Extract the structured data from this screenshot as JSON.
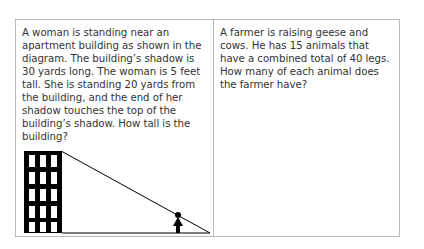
{
  "problems": [
    {
      "text": "A woman is standing near an apartment building as shown in the diagram. The building’s shadow is 30 yards long. The woman is 5 feet tall. She is standing 20 yards from the building, and the end of her shadow touches the top of the building’s shadow. How tall is the building?",
      "diagram": {
        "building_shadow": "30 yards",
        "woman_height": "5 feet",
        "woman_distance": "20 yards"
      }
    },
    {
      "text": "A farmer is raising geese and cows. He has 15 animals that have a combined total of 40 legs. How many of each animal does the farmer have?"
    }
  ],
  "colors": {
    "border": "#b8b8b8",
    "text": "#333333",
    "ink": "#000000"
  }
}
